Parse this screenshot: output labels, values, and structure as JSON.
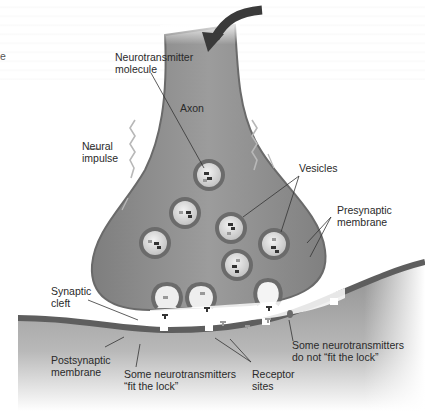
{
  "diagram": {
    "colors": {
      "axon_fill": "#8e8e8e",
      "axon_edge": "#6a6a6a",
      "vesicle_ring": "#6b6b6b",
      "vesicle_inner": "#d8d8d8",
      "postsynaptic_fill": "#9a9a9a",
      "membrane": "#5a5a5a",
      "background": "#ffffff",
      "arrow": "#3a3a3a"
    },
    "labels": {
      "edge_fragment": "e",
      "neurotransmitter_molecule": [
        "Neurotransmitter",
        "molecule"
      ],
      "axon": "Axon",
      "neural_impulse": [
        "Neural",
        "impulse"
      ],
      "vesicles": "Vesicles",
      "presynaptic_membrane": [
        "Presynaptic",
        "membrane"
      ],
      "synaptic_cleft": [
        "Synaptic",
        "cleft"
      ],
      "postsynaptic_membrane": [
        "Postsynaptic",
        "membrane"
      ],
      "fit_the_lock": [
        "Some neurotransmitters",
        "“fit the lock”"
      ],
      "receptor_sites": [
        "Receptor",
        "sites"
      ],
      "not_fit_the_lock": [
        "Some neurotransmitters",
        "do not “fit the lock”"
      ]
    }
  }
}
